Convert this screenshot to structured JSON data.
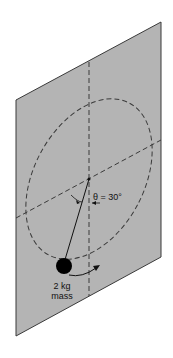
{
  "diagram": {
    "type": "conical pendulum on inclined plane",
    "colors": {
      "plane_fill": "#b4b4b4",
      "plane_edge": "#3a3a3a",
      "dashed": "#3a3a3a",
      "mass": "#000000",
      "background": "#ffffff"
    },
    "labels": {
      "angle": "θ = 30°",
      "mass_line1": "2 kg",
      "mass_line2": "mass"
    }
  }
}
